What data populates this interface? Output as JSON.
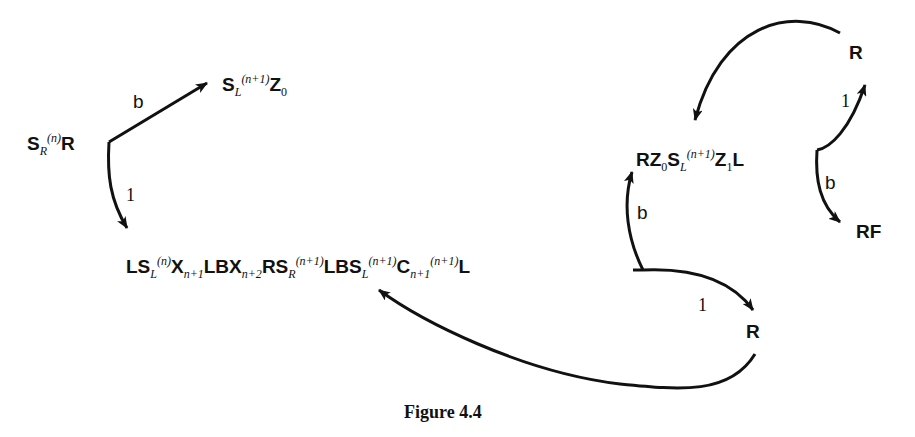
{
  "figure": {
    "caption": "Figure 4.4"
  },
  "nodes": {
    "start": {
      "base": "S",
      "sub": "R",
      "sup": "(n)",
      "tail": "R"
    },
    "top_left": {
      "base": "S",
      "sub": "L",
      "sup": "(n+1)",
      "tail": "Z",
      "tail_sub": "0"
    },
    "main": {
      "p1": "LS",
      "p1_sub": "L",
      "p1_sup": "(n)",
      "p2": "X",
      "p2_sub": "n+1",
      "p3": "LBX",
      "p3_sub": "n+2",
      "p4": "RS",
      "p4_sub": "R",
      "p4_sup": "(n+1)",
      "p5": "LBS",
      "p5_sub": "L",
      "p5_sup": "(n+1)",
      "p6": "C",
      "p6_sub": "n+1",
      "p6_sup": "(n+1)",
      "p7": "L"
    },
    "right_mid": {
      "p1": "RZ",
      "p1_sub": "0",
      "p2": "S",
      "p2_sub": "L",
      "p2_sup": "(n+1)",
      "p3": "Z",
      "p3_sub": "1",
      "p4": "L"
    },
    "r_top": "R",
    "r_bottom": "R",
    "rf": "RF"
  },
  "edge_labels": {
    "start_to_top_left": "b",
    "start_to_main": "1",
    "main_to_right_mid": "b",
    "main_to_r_bottom": "1",
    "branch_to_r_top": "1",
    "branch_to_rf": "b"
  },
  "colors": {
    "ink": "#111111",
    "background": "#ffffff"
  }
}
